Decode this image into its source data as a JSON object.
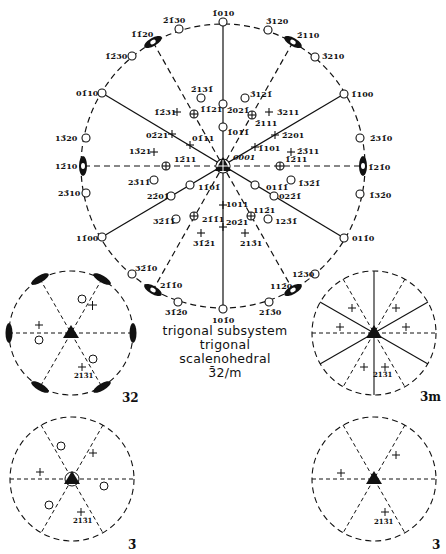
{
  "caption": {
    "line1": "trigonal subsystem",
    "line2": "trigonal",
    "line3": "scalenohedral",
    "line4": "3̄2/m"
  },
  "main_stereogram": {
    "center_label": "0001",
    "rim_labels": [
      {
        "text": "1̄010",
        "x": 212,
        "y": 9
      },
      {
        "text": "2̄1̄30",
        "x": 163,
        "y": 16
      },
      {
        "text": "3̄120",
        "x": 266,
        "y": 17
      },
      {
        "text": "1̄1̄20",
        "x": 131,
        "y": 30
      },
      {
        "text": "2̄110",
        "x": 297,
        "y": 31
      },
      {
        "text": "1̄2̄30",
        "x": 105,
        "y": 52
      },
      {
        "text": "3̄210",
        "x": 322,
        "y": 52
      },
      {
        "text": "01̄10",
        "x": 76,
        "y": 89
      },
      {
        "text": "1̄100",
        "x": 351,
        "y": 90
      },
      {
        "text": "13̄20",
        "x": 55,
        "y": 134
      },
      {
        "text": "2̄31̄0",
        "x": 370,
        "y": 134
      },
      {
        "text": "12̄10",
        "x": 55,
        "y": 162
      },
      {
        "text": "1̄21̄0",
        "x": 368,
        "y": 163
      },
      {
        "text": "23̄10",
        "x": 58,
        "y": 189
      },
      {
        "text": "1̄32̄0",
        "x": 369,
        "y": 191
      },
      {
        "text": "11̄00",
        "x": 76,
        "y": 234
      },
      {
        "text": "011̄0",
        "x": 352,
        "y": 234
      },
      {
        "text": "32̄1̄0",
        "x": 135,
        "y": 264
      },
      {
        "text": "12̄30",
        "x": 292,
        "y": 270
      },
      {
        "text": "21̄1̄0",
        "x": 160,
        "y": 281
      },
      {
        "text": "112̄0",
        "x": 270,
        "y": 282
      },
      {
        "text": "31̄2̄0",
        "x": 165,
        "y": 308
      },
      {
        "text": "21̄3̄0",
        "x": 259,
        "y": 308
      },
      {
        "text": "101̄0",
        "x": 212,
        "y": 316
      }
    ],
    "inner_labels": [
      {
        "text": "2̄131̄",
        "x": 191,
        "y": 85
      },
      {
        "text": "3̄121̄",
        "x": 250,
        "y": 90
      },
      {
        "text": "1̄1̄21",
        "x": 200,
        "y": 105
      },
      {
        "text": "2̄021̄",
        "x": 227,
        "y": 106
      },
      {
        "text": "1̄2̄31",
        "x": 154,
        "y": 108
      },
      {
        "text": "3̄211",
        "x": 277,
        "y": 108
      },
      {
        "text": "2̄111",
        "x": 255,
        "y": 119
      },
      {
        "text": "1̄011̄",
        "x": 227,
        "y": 128
      },
      {
        "text": "02̄21",
        "x": 146,
        "y": 131
      },
      {
        "text": "2̄201",
        "x": 282,
        "y": 131
      },
      {
        "text": "01̄11",
        "x": 192,
        "y": 134
      },
      {
        "text": "1̄101",
        "x": 258,
        "y": 144
      },
      {
        "text": "13̄21",
        "x": 129,
        "y": 147
      },
      {
        "text": "2̄3̄11",
        "x": 297,
        "y": 147
      },
      {
        "text": "12̄11",
        "x": 174,
        "y": 155
      },
      {
        "text": "1̄2̄11",
        "x": 285,
        "y": 155
      },
      {
        "text": "23̄11̄",
        "x": 128,
        "y": 178
      },
      {
        "text": "1̄32̄1̄",
        "x": 298,
        "y": 179
      },
      {
        "text": "11̄01̄",
        "x": 198,
        "y": 183
      },
      {
        "text": "011̄1̄",
        "x": 266,
        "y": 183
      },
      {
        "text": "22̄01̄",
        "x": 147,
        "y": 192
      },
      {
        "text": "022̄1̄",
        "x": 279,
        "y": 192
      },
      {
        "text": "1011",
        "x": 226,
        "y": 200
      },
      {
        "text": "112̄1",
        "x": 253,
        "y": 206
      },
      {
        "text": "32̄1̄1̄",
        "x": 153,
        "y": 217
      },
      {
        "text": "21̄1̄1",
        "x": 202,
        "y": 215
      },
      {
        "text": "202̄1",
        "x": 226,
        "y": 218
      },
      {
        "text": "123̄1̄",
        "x": 275,
        "y": 217
      },
      {
        "text": "31̄2̄1",
        "x": 193,
        "y": 239
      },
      {
        "text": "213̄1",
        "x": 240,
        "y": 239
      }
    ]
  },
  "sub_stereograms": [
    {
      "id": "32",
      "label": "32",
      "pole_label": "213̄1"
    },
    {
      "id": "3m",
      "label": "3m",
      "pole_label": "213̄1"
    },
    {
      "id": "3bar",
      "label": "3̄",
      "pole_label": "213̄1"
    },
    {
      "id": "3",
      "label": "3",
      "pole_label": "213̄1"
    }
  ],
  "colors": {
    "ink": "#111111",
    "background": "#ffffff"
  }
}
